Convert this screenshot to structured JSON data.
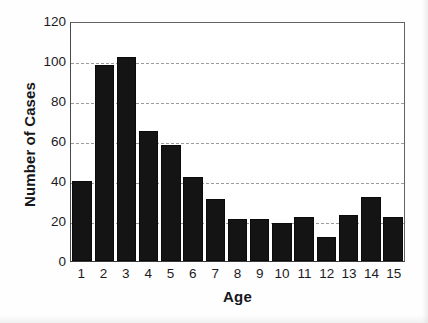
{
  "chart_data": {
    "type": "bar",
    "title": "",
    "xlabel": "Age",
    "ylabel": "Number of Cases",
    "categories": [
      "1",
      "2",
      "3",
      "4",
      "5",
      "6",
      "7",
      "8",
      "9",
      "10",
      "11",
      "12",
      "13",
      "14",
      "15"
    ],
    "values": [
      40,
      98,
      102,
      65,
      58,
      42,
      31,
      21,
      21,
      19,
      22,
      12,
      23,
      32,
      22
    ],
    "ylim": [
      0,
      120
    ],
    "yticks": [
      0,
      20,
      40,
      60,
      80,
      100,
      120
    ],
    "gridlines": [
      20,
      40,
      60,
      80,
      100
    ],
    "grid": true,
    "grid_style": "dashed",
    "legend": "none",
    "bar_color": "#141414",
    "background_color": "#ffffff",
    "axis_color": "#3a3a3d"
  }
}
